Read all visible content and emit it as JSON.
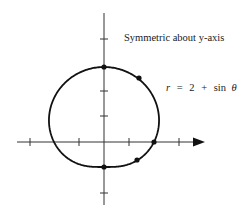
{
  "diagram": {
    "type": "polar-curve",
    "annotation": "Symmetric about y-axis",
    "equation": "r = 2 + sin θ",
    "equation_parts": {
      "lhs": "r",
      "eq": "=",
      "const": "2",
      "plus": "+",
      "func": "sin",
      "var": "θ"
    },
    "axes": {
      "x_ticks": [
        -3,
        -1,
        1,
        3
      ],
      "y_ticks": [
        -2,
        1,
        2,
        4
      ],
      "x_arrow": true
    },
    "highlighted_points": [
      {
        "theta": "π/2",
        "r": 3,
        "x": 0,
        "y": 3
      },
      {
        "theta": "π/4",
        "r": 2.71,
        "x": 1.91,
        "y": 2.71
      },
      {
        "theta": "0",
        "r": 2,
        "x": 2,
        "y": 0
      },
      {
        "theta": "-π/4",
        "r": 1.29,
        "x": 0.91,
        "y": -0.91
      },
      {
        "theta": "-π/2",
        "r": 1,
        "x": 0,
        "y": -1
      }
    ],
    "colors": {
      "curve": "#111111",
      "axes": "#333333",
      "text": "#1a1a1a"
    }
  }
}
